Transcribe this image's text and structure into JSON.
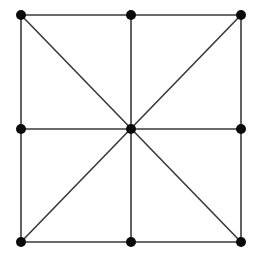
{
  "figure": {
    "name": "square-grid-graph",
    "background_color": "#ffffff",
    "width": 258,
    "height": 256
  },
  "style": {
    "edge_color": "#3a3a3a",
    "edge_width": 1.6,
    "node_color": "#0a0a0a",
    "node_radius": 5.0
  },
  "chart_data": {
    "type": "diagram",
    "subtype": "node-link-graph",
    "xlabel": "",
    "ylabel": "",
    "xlim": [
      0,
      258
    ],
    "ylim": [
      0,
      256
    ],
    "grid": false,
    "legend": false,
    "node_count": 9,
    "edge_count": 12,
    "nodes": [
      {
        "id": "top-left",
        "label": "top-left",
        "x": 21,
        "y": 15
      },
      {
        "id": "top-middle",
        "label": "top-middle",
        "x": 131,
        "y": 15
      },
      {
        "id": "top-right",
        "label": "top-right",
        "x": 241,
        "y": 15
      },
      {
        "id": "middle-left",
        "label": "middle-left",
        "x": 21,
        "y": 129
      },
      {
        "id": "center",
        "label": "center",
        "x": 131,
        "y": 129
      },
      {
        "id": "middle-right",
        "label": "middle-right",
        "x": 241,
        "y": 129
      },
      {
        "id": "bottom-left",
        "label": "bottom-left",
        "x": 21,
        "y": 242
      },
      {
        "id": "bottom-middle",
        "label": "bottom-middle",
        "x": 131,
        "y": 242
      },
      {
        "id": "bottom-right",
        "label": "bottom-right",
        "x": 241,
        "y": 242
      }
    ],
    "edges": [
      {
        "id": "edge-top-left-to-top-middle",
        "source": "top-left",
        "target": "top-middle",
        "kind": "border-top"
      },
      {
        "id": "edge-top-middle-to-top-right",
        "source": "top-middle",
        "target": "top-right",
        "kind": "border-top"
      },
      {
        "id": "edge-top-left-to-middle-left",
        "source": "top-left",
        "target": "middle-left",
        "kind": "border-left"
      },
      {
        "id": "edge-middle-left-to-bottom-left",
        "source": "middle-left",
        "target": "bottom-left",
        "kind": "border-left"
      },
      {
        "id": "edge-top-right-to-middle-right",
        "source": "top-right",
        "target": "middle-right",
        "kind": "border-right"
      },
      {
        "id": "edge-middle-right-to-bottom-right",
        "source": "middle-right",
        "target": "bottom-right",
        "kind": "border-right"
      },
      {
        "id": "edge-bottom-left-to-bottom-middle",
        "source": "bottom-left",
        "target": "bottom-middle",
        "kind": "border-bottom"
      },
      {
        "id": "edge-bottom-middle-to-bottom-right",
        "source": "bottom-middle",
        "target": "bottom-right",
        "kind": "border-bottom"
      },
      {
        "id": "edge-middle-left-to-middle-right",
        "source": "middle-left",
        "target": "middle-right",
        "kind": "median-horizontal"
      },
      {
        "id": "edge-top-middle-to-bottom-middle",
        "source": "top-middle",
        "target": "bottom-middle",
        "kind": "median-vertical"
      },
      {
        "id": "edge-top-left-to-bottom-right",
        "source": "top-left",
        "target": "bottom-right",
        "kind": "diagonal-main"
      },
      {
        "id": "edge-top-right-to-bottom-left",
        "source": "top-right",
        "target": "bottom-left",
        "kind": "diagonal-anti"
      }
    ]
  }
}
